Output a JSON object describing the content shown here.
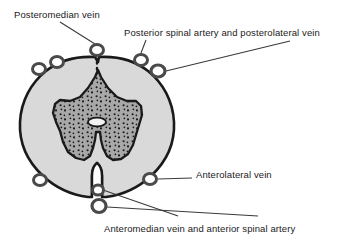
{
  "figure": {
    "type": "anatomical-cross-section",
    "background_color": "#ffffff"
  },
  "colors": {
    "outline": "#1a1a1a",
    "white_matter_fill": "#d9d9d9",
    "gray_matter_fill": "#a8a8a8",
    "gray_matter_stipple": "#1a1a1a",
    "vessel_ring_stroke": "#4a4a4a",
    "vessel_ring_fill": "#ffffff",
    "leader_line": "#3a3a3a",
    "text": "#1a1a1a"
  },
  "labels": {
    "posteromedian_vein": "Posteromedian vein",
    "posterior_spinal": "Posterior spinal artery and posterolateral vein",
    "anterolateral_vein": "Anterolateral vein",
    "anteromedian_vein": "Anteromedian vein and anterior spinal artery"
  },
  "structures": {
    "white_matter": "white-matter",
    "gray_matter": "gray-matter-butterfly",
    "central_canal": "central-canal",
    "posterior_median_sulcus": "posterior-median-sulcus",
    "anterior_median_fissure": "anterior-median-fissure"
  },
  "vessels": [
    {
      "name": "posteromedian-vein-ring",
      "cx": 97,
      "cy": 50,
      "rx": 6.5,
      "ry": 5.5
    },
    {
      "name": "posterolateral-vessel-ring-left-outer",
      "cx": 39,
      "cy": 69,
      "rx": 6.5,
      "ry": 5.5
    },
    {
      "name": "posterolateral-vessel-ring-left-inner",
      "cx": 57,
      "cy": 62,
      "rx": 6.5,
      "ry": 5.5
    },
    {
      "name": "posterior-spinal-artery-ring",
      "cx": 141,
      "cy": 60,
      "rx": 6.5,
      "ry": 5.5
    },
    {
      "name": "posterolateral-vein-ring",
      "cx": 158,
      "cy": 71,
      "rx": 7.0,
      "ry": 6.0
    },
    {
      "name": "anterolateral-vein-ring-left",
      "cx": 40,
      "cy": 180,
      "rx": 6.5,
      "ry": 5.5
    },
    {
      "name": "anterolateral-vein-ring-right",
      "cx": 150,
      "cy": 179,
      "rx": 6.5,
      "ry": 5.5
    },
    {
      "name": "anteromedian-vein-ring",
      "cx": 98,
      "cy": 190,
      "rx": 5.5,
      "ry": 5.0
    },
    {
      "name": "anterior-spinal-artery-ring",
      "cx": 99,
      "cy": 206,
      "rx": 7.0,
      "ry": 6.5
    }
  ]
}
